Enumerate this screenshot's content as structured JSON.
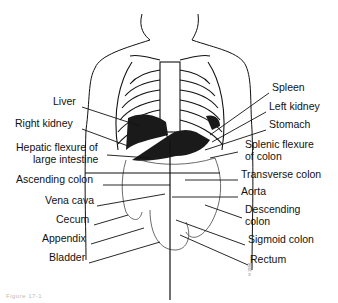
{
  "diagram": {
    "caption": "Figure 17-1",
    "credit": "© 1994",
    "labels_left": [
      {
        "text": "Liver",
        "x": 53,
        "y": 101
      },
      {
        "text": "Right kidney",
        "x": 15,
        "y": 123
      },
      {
        "text": "Hepatic flexure of",
        "x": 16,
        "y": 147
      },
      {
        "text": "large intestine",
        "x": 33,
        "y": 159
      },
      {
        "text": "Ascending colon",
        "x": 16,
        "y": 179
      },
      {
        "text": "Vena cava",
        "x": 45,
        "y": 200
      },
      {
        "text": "Cecum",
        "x": 56,
        "y": 219
      },
      {
        "text": "Appendix",
        "x": 42,
        "y": 238
      },
      {
        "text": "Bladder",
        "x": 49,
        "y": 257
      }
    ],
    "labels_right": [
      {
        "text": "Spleen",
        "x": 272,
        "y": 87
      },
      {
        "text": "Left kidney",
        "x": 269,
        "y": 106
      },
      {
        "text": "Stomach",
        "x": 269,
        "y": 124
      },
      {
        "text": "Splenic flexure",
        "x": 245,
        "y": 144
      },
      {
        "text": "of colon",
        "x": 245,
        "y": 156
      },
      {
        "text": "Transverse colon",
        "x": 241,
        "y": 174
      },
      {
        "text": "Aorta",
        "x": 241,
        "y": 191
      },
      {
        "text": "Descending",
        "x": 245,
        "y": 209
      },
      {
        "text": "colon",
        "x": 245,
        "y": 221
      },
      {
        "text": "Sigmoid colon",
        "x": 248,
        "y": 239
      },
      {
        "text": "Rectum",
        "x": 250,
        "y": 259
      }
    ],
    "colors": {
      "line": "#111111",
      "organ_dark": "#1a1a1a",
      "background": "#ffffff"
    }
  }
}
